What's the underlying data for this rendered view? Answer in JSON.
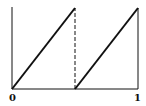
{
  "chart_data": {
    "type": "line",
    "title": "",
    "xlabel": "",
    "ylabel": "",
    "xlim": [
      0,
      1
    ],
    "ylim": [
      0,
      1
    ],
    "grid": false,
    "legend": null,
    "x_tick_labels": [
      "0",
      "1"
    ],
    "series": [
      {
        "name": "sawtooth",
        "style": "solid",
        "segments": [
          {
            "x": [
              0,
              0.5
            ],
            "y": [
              0,
              1
            ]
          },
          {
            "x": [
              0.5,
              1
            ],
            "y": [
              0,
              1
            ]
          }
        ]
      },
      {
        "name": "discontinuity",
        "style": "dashed",
        "segments": [
          {
            "x": [
              0.5,
              0.5
            ],
            "y": [
              0,
              1
            ]
          }
        ]
      }
    ],
    "annotations": []
  },
  "labels": {
    "x0": "0",
    "x1": "1"
  },
  "colors": {
    "line": "#111111",
    "background": "#ffffff"
  }
}
